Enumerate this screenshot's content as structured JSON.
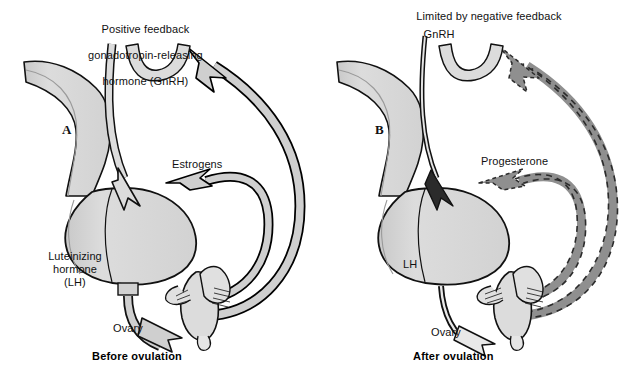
{
  "figure": {
    "background_color": "#ffffff",
    "text_color": "#111111"
  },
  "palette": {
    "organ_fill": "#d6d6d6",
    "organ_fill_light": "#e2e2e2",
    "organ_stroke": "#111111",
    "positive_arrow_fill": "#cfcfcf",
    "positive_arrow_stroke": "#000000",
    "negative_arrow_fill": "#8f8f8f",
    "negative_arrow_stroke": "#2b2b2b",
    "stalk_fill": "#dcdcdc"
  },
  "panels": [
    {
      "id": "A",
      "letter": "A",
      "caption": "Before ovulation",
      "feedback_type": "positive",
      "labels": [
        {
          "name": "gnrh-label",
          "lines": [
            "Positive feedback",
            "gonadotropin-releasing",
            "hormone (GnRH)"
          ],
          "text": "Positive feedback\ngonadotropin-releasing\nhormone (GnRH)"
        },
        {
          "name": "estrogens-label",
          "text": "Estrogens"
        },
        {
          "name": "lh-label",
          "text": "Luteinizing\nhormone\n(LH)"
        },
        {
          "name": "ovary-label",
          "text": "Ovary"
        }
      ],
      "structures": [
        "hypothalamus",
        "pituitary-gland",
        "ovary"
      ],
      "arrows": [
        {
          "name": "gnrh-arrow",
          "from": "hypothalamus",
          "to": "pituitary-gland",
          "style": "solid-light"
        },
        {
          "name": "lh-arrow",
          "from": "pituitary-gland",
          "to": "ovary",
          "style": "solid-light"
        },
        {
          "name": "estrogen-feedback-pituitary",
          "from": "ovary",
          "to": "pituitary-gland",
          "style": "solid-light"
        },
        {
          "name": "estrogen-feedback-hypothalamus",
          "from": "ovary",
          "to": "hypothalamus",
          "style": "solid-light"
        }
      ]
    },
    {
      "id": "B",
      "letter": "B",
      "caption": "After ovulation",
      "feedback_type": "negative",
      "labels": [
        {
          "name": "negative-feedback-label",
          "lines": [
            "Limited by negative feedback"
          ],
          "text": "Limited by negative feedback"
        },
        {
          "name": "gnrh-label",
          "text": "GnRH"
        },
        {
          "name": "progesterone-label",
          "text": "Progesterone"
        },
        {
          "name": "lh-label",
          "text": "LH"
        },
        {
          "name": "ovary-label",
          "text": "Ovary"
        }
      ],
      "structures": [
        "hypothalamus",
        "pituitary-gland",
        "ovary"
      ],
      "arrows": [
        {
          "name": "gnrh-arrow",
          "from": "hypothalamus",
          "to": "pituitary-gland",
          "style": "solid-thin"
        },
        {
          "name": "lh-arrow",
          "from": "pituitary-gland",
          "to": "ovary",
          "style": "solid-thin"
        },
        {
          "name": "progesterone-feedback-pituitary",
          "from": "ovary",
          "to": "pituitary-gland",
          "style": "dashed-dark"
        },
        {
          "name": "progesterone-feedback-hypothalamus",
          "from": "ovary",
          "to": "hypothalamus",
          "style": "dashed-dark"
        }
      ]
    }
  ]
}
